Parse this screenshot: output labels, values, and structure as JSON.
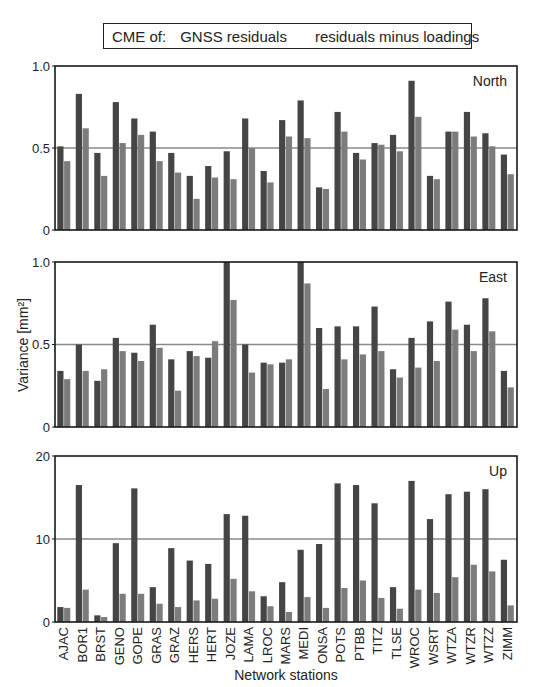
{
  "chart_data": {
    "type": "bar",
    "legend": {
      "prefix": "CME of:",
      "entries": [
        "GNSS residuals",
        "residuals minus loadings"
      ],
      "position": "top"
    },
    "xlabel": "Network stations",
    "ylabel": "Variance [mm²]",
    "categories": [
      "AJAC",
      "BOR1",
      "BRST",
      "GENO",
      "GOPE",
      "GRAS",
      "GRAZ",
      "HERS",
      "HERT",
      "JOZE",
      "LAMA",
      "LROC",
      "MARS",
      "MEDI",
      "ONSA",
      "POTS",
      "PTBB",
      "TITZ",
      "TLSE",
      "WROC",
      "WSRT",
      "WTZA",
      "WTZR",
      "WTZZ",
      "ZIMM"
    ],
    "panels": [
      {
        "title": "North",
        "ylim": [
          0,
          1.0
        ],
        "yticks": [
          "0",
          "0.5",
          "1.0"
        ],
        "ytick_values": [
          0,
          0.5,
          1.0
        ],
        "reference_line": 0.5,
        "series": [
          {
            "name": "GNSS residuals",
            "values": [
              0.51,
              0.83,
              0.47,
              0.78,
              0.68,
              0.6,
              0.47,
              0.33,
              0.39,
              0.48,
              0.68,
              0.36,
              0.67,
              0.79,
              0.26,
              0.72,
              0.47,
              0.53,
              0.58,
              0.91,
              0.33,
              0.6,
              0.72,
              0.59,
              0.46
            ]
          },
          {
            "name": "residuals minus loadings",
            "values": [
              0.42,
              0.62,
              0.33,
              0.53,
              0.58,
              0.42,
              0.35,
              0.19,
              0.32,
              0.31,
              0.5,
              0.29,
              0.57,
              0.56,
              0.25,
              0.6,
              0.43,
              0.52,
              0.48,
              0.69,
              0.31,
              0.6,
              0.57,
              0.51,
              0.34
            ]
          }
        ]
      },
      {
        "title": "East",
        "ylim": [
          0,
          1.0
        ],
        "yticks": [
          "0",
          "0.5",
          "1.0"
        ],
        "ytick_values": [
          0,
          0.5,
          1.0
        ],
        "reference_line": 0.5,
        "series": [
          {
            "name": "GNSS residuals",
            "values": [
              0.34,
              0.5,
              0.28,
              0.54,
              0.45,
              0.62,
              0.41,
              0.46,
              0.42,
              1.0,
              0.5,
              0.39,
              0.39,
              1.0,
              0.6,
              0.61,
              0.61,
              0.73,
              0.35,
              0.54,
              0.64,
              0.76,
              0.62,
              0.78,
              0.34
            ]
          },
          {
            "name": "residuals minus loadings",
            "values": [
              0.29,
              0.34,
              0.35,
              0.46,
              0.4,
              0.48,
              0.22,
              0.43,
              0.52,
              0.77,
              0.33,
              0.38,
              0.41,
              0.87,
              0.23,
              0.41,
              0.44,
              0.46,
              0.3,
              0.36,
              0.4,
              0.59,
              0.46,
              0.58,
              0.24
            ]
          }
        ]
      },
      {
        "title": "Up",
        "ylim": [
          0,
          20
        ],
        "yticks": [
          "0",
          "10",
          "20"
        ],
        "ytick_values": [
          0,
          10,
          20
        ],
        "reference_line": 10,
        "series": [
          {
            "name": "GNSS residuals",
            "values": [
              1.8,
              16.5,
              0.8,
              9.5,
              16.1,
              4.2,
              8.9,
              7.4,
              7.0,
              13.0,
              12.8,
              3.1,
              4.8,
              8.7,
              9.4,
              16.7,
              16.5,
              14.3,
              4.2,
              17.0,
              12.4,
              15.4,
              15.7,
              16.0,
              7.5
            ]
          },
          {
            "name": "residuals minus loadings",
            "values": [
              1.7,
              3.9,
              0.6,
              3.4,
              3.4,
              2.2,
              1.8,
              2.6,
              2.8,
              5.2,
              3.7,
              1.9,
              1.2,
              3.0,
              1.7,
              4.1,
              5.0,
              2.9,
              1.6,
              3.9,
              3.5,
              5.4,
              6.9,
              6.1,
              2.0
            ]
          }
        ]
      }
    ],
    "colors": {
      "series_dark": "#454545",
      "series_light": "#7c7c7c",
      "reference_line": "#8a8a8a",
      "axis": "#1a1a1a"
    },
    "grid": false
  }
}
